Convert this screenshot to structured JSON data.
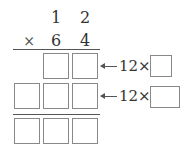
{
  "multiplicand": {
    "tens": "1",
    "ones": "2"
  },
  "operator": "×",
  "multiplier": {
    "tens": "6",
    "ones": "4"
  },
  "partial_products": [
    {
      "boxes": 2,
      "annotation": "12×",
      "answer_box": ""
    },
    {
      "boxes": 3,
      "annotation": "12×",
      "answer_box": ""
    }
  ],
  "result": {
    "boxes": 3
  }
}
